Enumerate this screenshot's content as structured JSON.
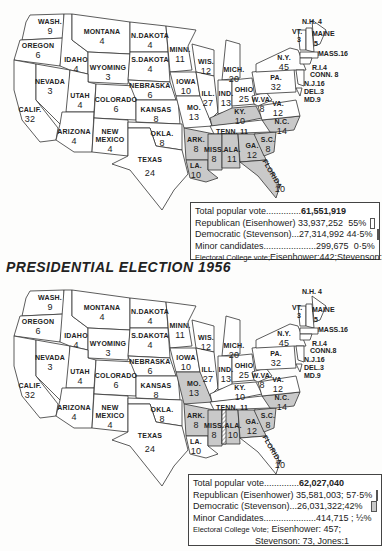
{
  "maps": [
    {
      "year": "1952",
      "legend": {
        "total": {
          "label": "Total popular vote..............",
          "value": "61,551,919"
        },
        "republican": {
          "label": "Republican (Eisenhower)",
          "value": "33,937,252",
          "pct": "55%"
        },
        "democratic": {
          "label": "Democratic (Stevenson)...",
          "value": "27,314,992",
          "pct": "44·5%"
        },
        "minor": {
          "label": "Minor candidates.....................",
          "value": "299,675",
          "pct": "0·5%"
        },
        "electoral_prefix": "Electoral College vote;",
        "electoral": "Eisenhower:442;Stevenson:89"
      },
      "states": {
        "wash": {
          "name": "WASH.",
          "ev": "9"
        },
        "oregon": {
          "name": "OREGON",
          "ev": "6"
        },
        "calif": {
          "name": "CALIF.",
          "ev": "32"
        },
        "nevada": {
          "name": "NEVADA",
          "ev": "3"
        },
        "idaho": {
          "name": "IDAHO",
          "ev": "4"
        },
        "montana": {
          "name": "MONTANA",
          "ev": "4"
        },
        "wyoming": {
          "name": "WYOMING",
          "ev": "3"
        },
        "utah": {
          "name": "UTAH",
          "ev": "4"
        },
        "arizona": {
          "name": "ARIZONA",
          "ev": "4"
        },
        "colorado": {
          "name": "COLORADO",
          "ev": "6"
        },
        "newmexico": {
          "name": "NEW MEXICO",
          "ev": "4"
        },
        "ndakota": {
          "name": "N.DAKOTA",
          "ev": "4"
        },
        "sdakota": {
          "name": "S.DAKOTA",
          "ev": "4"
        },
        "nebraska": {
          "name": "NEBRASKA",
          "ev": "6"
        },
        "kansas": {
          "name": "KANSAS",
          "ev": "8"
        },
        "okla": {
          "name": "OKLA.",
          "ev": "8"
        },
        "texas": {
          "name": "TEXAS",
          "ev": "24"
        },
        "minn": {
          "name": "MINN.",
          "ev": "11"
        },
        "iowa": {
          "name": "IOWA",
          "ev": "10"
        },
        "mo": {
          "name": "MO.",
          "ev": "13"
        },
        "ark": {
          "name": "ARK.",
          "ev": "8"
        },
        "la": {
          "name": "LA.",
          "ev": "10"
        },
        "wis": {
          "name": "WIS.",
          "ev": "12"
        },
        "ill": {
          "name": "ILL.",
          "ev": "27"
        },
        "mich": {
          "name": "MICH.",
          "ev": "20"
        },
        "ind": {
          "name": "IND.",
          "ev": "13"
        },
        "ohio": {
          "name": "OHIO",
          "ev": "25"
        },
        "ky": {
          "name": "KY.",
          "ev": "10"
        },
        "tenn": {
          "name": "TENN.",
          "ev": "11"
        },
        "miss": {
          "name": "MISS.",
          "ev": "8"
        },
        "ala": {
          "name": "ALA.",
          "ev": "11"
        },
        "ga": {
          "name": "GA.",
          "ev": "12"
        },
        "florida": {
          "name": "FLORIDA",
          "ev": "10"
        },
        "sc": {
          "name": "S.C.",
          "ev": "8"
        },
        "nc": {
          "name": "N.C.",
          "ev": "14"
        },
        "va": {
          "name": "VA.",
          "ev": "12"
        },
        "wva": {
          "name": "W.VA.",
          "ev": "8"
        },
        "pa": {
          "name": "PA.",
          "ev": "32"
        },
        "ny": {
          "name": "N.Y.",
          "ev": "45"
        },
        "vt": {
          "name": "VT.",
          "ev": "3"
        },
        "nh": {
          "name": "N.H.",
          "ev": "4"
        },
        "maine": {
          "name": "MAINE",
          "ev": "5"
        },
        "mass": "MASS.16",
        "ri": "R.I.4",
        "conn": "CONN. 8",
        "nj": "N.J.16",
        "del": "DEL.3",
        "md": "MD.9"
      }
    },
    {
      "year": "1956",
      "title": "PRESIDENTIAL ELECTION 1956",
      "legend": {
        "total": {
          "label": "Total popular vote..............",
          "value": "62,027,040"
        },
        "republican": {
          "label": "Republican (Eisenhower)",
          "value": "35,581,003;",
          "pct": "57·5%"
        },
        "democratic": {
          "label": "Democratic (Stevenson)...",
          "value": "26,031,322;",
          "pct": "42%"
        },
        "minor": {
          "label": "Minor Candidates.....................",
          "value": "414,715 ;",
          "pct": "½%"
        },
        "electoral_prefix": "Electoral College Vote;",
        "electoral": "Eisenhower: 457;",
        "electoral2": "Stevenson: 73, Jones:1"
      },
      "states": {
        "wash": {
          "name": "WASH.",
          "ev": "9"
        },
        "oregon": {
          "name": "OREGON",
          "ev": "6"
        },
        "calif": {
          "name": "CALIF.",
          "ev": "32"
        },
        "nevada": {
          "name": "NEVADA",
          "ev": "3"
        },
        "idaho": {
          "name": "IDAHO",
          "ev": "4"
        },
        "montana": {
          "name": "MONTANA",
          "ev": "4"
        },
        "wyoming": {
          "name": "WYOMING",
          "ev": "3"
        },
        "utah": {
          "name": "UTAH",
          "ev": "4"
        },
        "arizona": {
          "name": "ARIZONA",
          "ev": "4"
        },
        "colorado": {
          "name": "COLORADO",
          "ev": "6"
        },
        "newmexico": {
          "name": "NEW MEXICO",
          "ev": "4"
        },
        "ndakota": {
          "name": "N.DAKOTA",
          "ev": "4"
        },
        "sdakota": {
          "name": "S.DAKOTA",
          "ev": "4"
        },
        "nebraska": {
          "name": "NEBRASKA",
          "ev": "6"
        },
        "kansas": {
          "name": "KANSAS",
          "ev": "8"
        },
        "okla": {
          "name": "OKLA.",
          "ev": "8"
        },
        "texas": {
          "name": "TEXAS",
          "ev": "24"
        },
        "minn": {
          "name": "MINN.",
          "ev": "11"
        },
        "iowa": {
          "name": "IOWA",
          "ev": "10"
        },
        "mo": {
          "name": "MO.",
          "ev": "13"
        },
        "ark": {
          "name": "ARK.",
          "ev": "8"
        },
        "la": {
          "name": "LA.",
          "ev": "10"
        },
        "wis": {
          "name": "WIS.",
          "ev": "12"
        },
        "ill": {
          "name": "ILL.",
          "ev": "27"
        },
        "mich": {
          "name": "MICH.",
          "ev": "20"
        },
        "ind": {
          "name": "IND.",
          "ev": "13"
        },
        "ohio": {
          "name": "OHIO",
          "ev": "25"
        },
        "ky": {
          "name": "KY.",
          "ev": "10"
        },
        "tenn": {
          "name": "TENN.",
          "ev": "11"
        },
        "miss": {
          "name": "MISS.",
          "ev": "8"
        },
        "ala": {
          "name": "ALA.",
          "ev": "10"
        },
        "ga": {
          "name": "GA.",
          "ev": "12"
        },
        "florida": {
          "name": "FLORIDA",
          "ev": "10"
        },
        "sc": {
          "name": "S.C.",
          "ev": "8"
        },
        "nc": {
          "name": "N.C.",
          "ev": "14"
        },
        "va": {
          "name": "VA.",
          "ev": "12"
        },
        "wva": {
          "name": "W.VA.",
          "ev": "8"
        },
        "pa": {
          "name": "PA.",
          "ev": "32"
        },
        "ny": {
          "name": "N.Y.",
          "ev": "45"
        },
        "vt": {
          "name": "VT.",
          "ev": "3"
        },
        "nh": {
          "name": "N.H.",
          "ev": "4"
        },
        "maine": {
          "name": "MAINE",
          "ev": "5"
        },
        "mass": "MASS.16",
        "ri": "R.I.4",
        "conn": "CONN.8",
        "nj": "N.J.16",
        "del": "DEL.3",
        "md": "MD.9"
      }
    }
  ],
  "colors": {
    "republican": "#ffffff",
    "democratic": "#c9c9c9",
    "outline": "#333333"
  }
}
